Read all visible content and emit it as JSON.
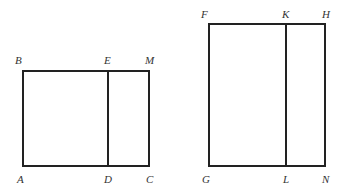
{
  "figure": {
    "stroke_color": "#222222",
    "label_color": "#333333",
    "rect_left": {
      "outer": {
        "x1": 23,
        "y1": 71,
        "x2": 149,
        "y2": 166
      },
      "divider_x": 108,
      "labels": {
        "B": {
          "text": "B",
          "x": 15,
          "y": 64
        },
        "E": {
          "text": "E",
          "x": 104,
          "y": 64
        },
        "M": {
          "text": "M",
          "x": 145,
          "y": 64
        },
        "A": {
          "text": "A",
          "x": 17,
          "y": 183
        },
        "D": {
          "text": "D",
          "x": 104,
          "y": 183
        },
        "C": {
          "text": "C",
          "x": 146,
          "y": 183
        }
      }
    },
    "rect_right": {
      "outer": {
        "x1": 209,
        "y1": 24,
        "x2": 325,
        "y2": 166
      },
      "divider_x": 286,
      "labels": {
        "F": {
          "text": "F",
          "x": 201,
          "y": 18
        },
        "K": {
          "text": "K",
          "x": 282,
          "y": 18
        },
        "H": {
          "text": "H",
          "x": 322,
          "y": 18
        },
        "G": {
          "text": "G",
          "x": 202,
          "y": 183
        },
        "L": {
          "text": "L",
          "x": 283,
          "y": 183
        },
        "N": {
          "text": "N",
          "x": 322,
          "y": 183
        }
      }
    }
  }
}
